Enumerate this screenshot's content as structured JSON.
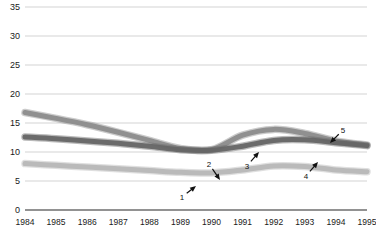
{
  "chart_data": {
    "type": "line",
    "title": "",
    "subtitle": "",
    "xlabel": "",
    "ylabel": "",
    "grid": true,
    "legend_position": "none",
    "x": [
      1984,
      1985,
      1986,
      1987,
      1988,
      1989,
      1990,
      1991,
      1992,
      1993,
      1994,
      1995
    ],
    "xtick_labels": [
      "1984",
      "1985",
      "1986",
      "1987",
      "1988",
      "1989",
      "1990",
      "1991",
      "1992",
      "1993",
      "1994",
      "1995"
    ],
    "ytick_labels": [
      "0",
      "5",
      "10",
      "15",
      "20",
      "25",
      "30",
      "35"
    ],
    "ytick_values": [
      0,
      5,
      10,
      15,
      20,
      25,
      30,
      35
    ],
    "ylim": [
      0,
      35
    ],
    "xlim": [
      1984,
      1995
    ],
    "series": [
      {
        "name": "series-1",
        "color": "#8c8c8c",
        "style": "thick-ribbon",
        "values": [
          16.8,
          15.8,
          14.7,
          13.4,
          12.0,
          10.6,
          10.4,
          12.9,
          13.9,
          13.2,
          11.9,
          11.2
        ]
      },
      {
        "name": "series-2",
        "color": "#666666",
        "style": "thick-ribbon",
        "values": [
          12.6,
          12.3,
          11.9,
          11.5,
          11.0,
          10.4,
          10.3,
          11.0,
          12.0,
          12.1,
          11.6,
          11.1
        ]
      },
      {
        "name": "series-3",
        "color": "#b7b7b7",
        "style": "thick-ribbon",
        "values": [
          8.0,
          7.7,
          7.4,
          7.1,
          6.8,
          6.5,
          6.4,
          6.9,
          7.6,
          7.5,
          6.9,
          6.6
        ]
      }
    ],
    "annotations": [
      {
        "label": "1",
        "label_x": 182,
        "label_y": 197,
        "tip_x": 196,
        "tip_y": 186
      },
      {
        "label": "2",
        "label_x": 209,
        "label_y": 164,
        "tip_x": 220,
        "tip_y": 180
      },
      {
        "label": "3",
        "label_x": 247,
        "label_y": 166,
        "tip_x": 259,
        "tip_y": 152
      },
      {
        "label": "4",
        "label_x": 306,
        "label_y": 176,
        "tip_x": 318,
        "tip_y": 162
      },
      {
        "label": "5",
        "label_x": 343,
        "label_y": 130,
        "tip_x": 330,
        "tip_y": 143
      }
    ]
  },
  "colors": {
    "axis": "#6e6e6e",
    "grid": "#c8c8c8",
    "text": "#1a1a1a",
    "background": "#ffffff"
  }
}
